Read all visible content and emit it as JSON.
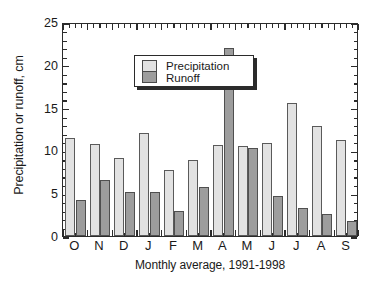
{
  "chart_data": {
    "type": "bar",
    "title": "",
    "xlabel": "Monthly average, 1991-1998",
    "ylabel": "Precipitation or runoff, cm",
    "categories": [
      "O",
      "N",
      "D",
      "J",
      "F",
      "M",
      "A",
      "M",
      "J",
      "J",
      "A",
      "S"
    ],
    "series": [
      {
        "name": "Precipitation",
        "color": "#e2e2e2",
        "values": [
          11.4,
          10.7,
          9.1,
          12.0,
          7.7,
          8.9,
          10.6,
          10.5,
          10.9,
          15.5,
          12.8,
          11.2
        ]
      },
      {
        "name": "Runoff",
        "color": "#9d9d9d",
        "values": [
          4.2,
          6.5,
          5.1,
          5.1,
          2.9,
          5.7,
          22.0,
          10.3,
          4.7,
          3.3,
          2.6,
          1.8
        ]
      }
    ],
    "ylim": [
      0,
      25
    ],
    "yticks": [
      0,
      5,
      10,
      15,
      20,
      25
    ],
    "ytick_labels": [
      "0",
      "5",
      "10",
      "15",
      "20",
      "25"
    ],
    "y_minor_step": 1,
    "grid": false,
    "legend_position": "upper left",
    "legend_entries": [
      "Precipitation",
      "Runoff"
    ],
    "axis_frame": true,
    "tick_direction": "in"
  }
}
